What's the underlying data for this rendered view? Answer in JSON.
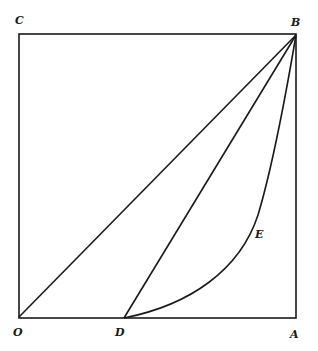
{
  "diagram": {
    "labels": {
      "C": "C",
      "B": "B",
      "O": "O",
      "D": "D",
      "A": "A",
      "E": "E"
    },
    "points": {
      "O": [
        18,
        317
      ],
      "A": [
        296,
        318
      ],
      "B": [
        296,
        35
      ],
      "C": [
        20,
        34
      ],
      "D": [
        124,
        318
      ]
    },
    "segments": [
      "OA",
      "AB",
      "BC",
      "CO",
      "OB",
      "DB"
    ],
    "curves": [
      {
        "name": "DEB",
        "from": "D",
        "to": "B",
        "through_label": "E"
      }
    ],
    "colors": {
      "stroke": "#1a1a1a",
      "background": "#ffffff"
    }
  }
}
